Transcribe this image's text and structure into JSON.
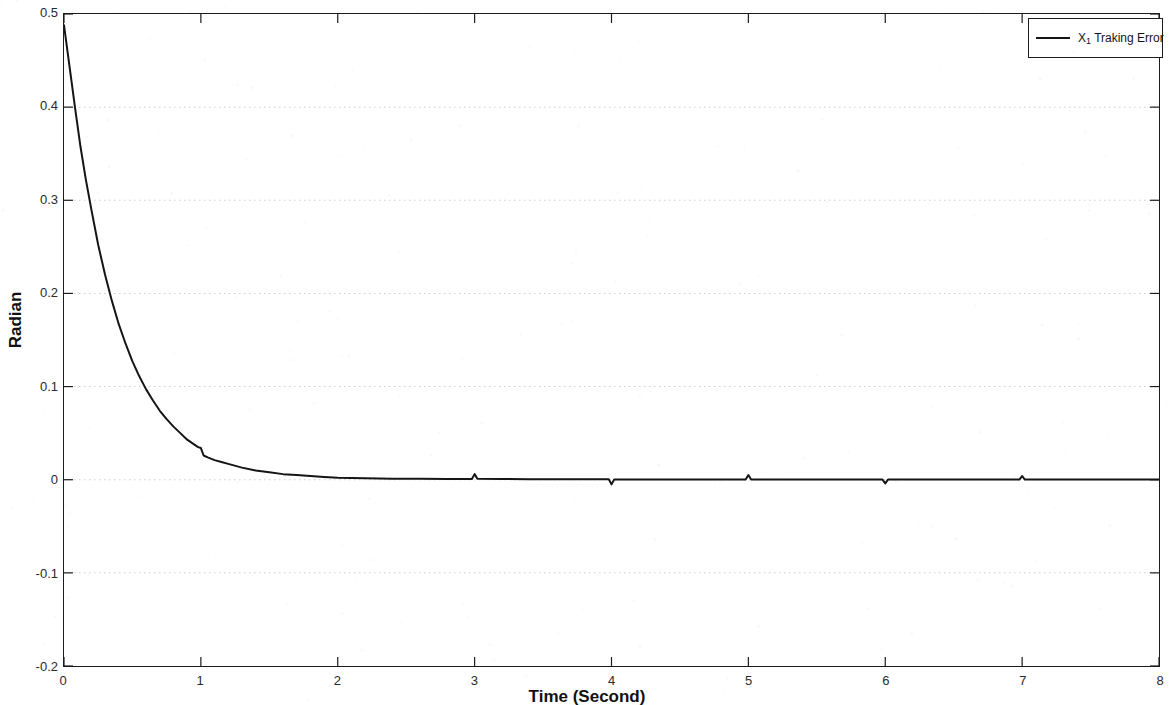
{
  "chart_data": {
    "type": "line",
    "title": "",
    "subtitle": "",
    "xlabel": "Time (Second)",
    "ylabel": "Radian",
    "xlim": [
      0,
      8
    ],
    "ylim": [
      -0.2,
      0.5
    ],
    "xticks": [
      "0",
      "1",
      "2",
      "3",
      "4",
      "5",
      "6",
      "7",
      "8"
    ],
    "xtick_values": [
      0,
      1,
      2,
      3,
      4,
      5,
      6,
      7,
      8
    ],
    "yticks": [
      "0.5",
      "0.4",
      "0.3",
      "0.2",
      "0.1",
      "0",
      "-0.1",
      "-0.2"
    ],
    "ytick_values": [
      0.5,
      0.4,
      0.3,
      0.2,
      0.1,
      0,
      -0.1,
      -0.2
    ],
    "grid": "horizontal-dotted",
    "grid_color": "#cfcfcf",
    "legend_position": "top-right",
    "line_color": "#151515",
    "line_width": 2.0,
    "series": [
      {
        "name": "X1 Traking Error",
        "label_base": "X",
        "label_sub": "1",
        "label_rest": " Traking Error",
        "x": [
          0,
          0.04,
          0.08,
          0.12,
          0.16,
          0.2,
          0.25,
          0.3,
          0.35,
          0.4,
          0.45,
          0.5,
          0.55,
          0.6,
          0.65,
          0.7,
          0.75,
          0.8,
          0.85,
          0.9,
          0.95,
          0.98,
          1.0,
          1.02,
          1.05,
          1.1,
          1.15,
          1.2,
          1.3,
          1.4,
          1.5,
          1.6,
          1.7,
          1.8,
          1.9,
          2.0,
          2.2,
          2.4,
          2.6,
          2.8,
          2.98,
          3.0,
          3.02,
          3.2,
          3.4,
          3.6,
          3.8,
          3.98,
          4.0,
          4.02,
          4.2,
          4.4,
          4.6,
          4.8,
          4.98,
          5.0,
          5.02,
          5.2,
          5.4,
          5.6,
          5.8,
          5.98,
          6.0,
          6.02,
          6.2,
          6.4,
          6.6,
          6.8,
          6.98,
          7.0,
          7.02,
          7.2,
          7.4,
          7.6,
          7.8,
          8.0
        ],
        "y": [
          0.488,
          0.444,
          0.4,
          0.358,
          0.322,
          0.29,
          0.252,
          0.22,
          0.192,
          0.167,
          0.146,
          0.127,
          0.111,
          0.097,
          0.085,
          0.074,
          0.065,
          0.057,
          0.05,
          0.043,
          0.038,
          0.035,
          0.034,
          0.026,
          0.024,
          0.021,
          0.019,
          0.017,
          0.013,
          0.01,
          0.008,
          0.006,
          0.005,
          0.004,
          0.003,
          0.002,
          0.0015,
          0.001,
          0.001,
          0.0008,
          0.0008,
          0.006,
          0.001,
          0.0008,
          0.0006,
          0.0005,
          0.0005,
          0.0005,
          -0.005,
          0.0003,
          0.0003,
          0.0003,
          0.0002,
          0.0002,
          0.0002,
          0.005,
          0.0002,
          0.0002,
          0.0002,
          0.0001,
          0.0001,
          0.0001,
          -0.004,
          0.0001,
          0.0001,
          0.0001,
          0.0001,
          0.0001,
          0.0001,
          0.004,
          0.0001,
          0.0001,
          0.0001,
          0.0001,
          0.0001,
          0.0001
        ],
        "description": "Exponential decay from 0.49 rad toward 0 with settling near t=1.5s, plus small transient spikes at t=1,3,4,5,6,7"
      }
    ],
    "annotations": [
      {
        "t": 1.0,
        "type": "spike-up",
        "magnitude": 0.008
      },
      {
        "t": 3.0,
        "type": "spike-up",
        "magnitude": 0.006
      },
      {
        "t": 4.0,
        "type": "spike-down",
        "magnitude": -0.005
      },
      {
        "t": 5.0,
        "type": "spike-up",
        "magnitude": 0.005
      },
      {
        "t": 6.0,
        "type": "spike-down",
        "magnitude": -0.004
      },
      {
        "t": 7.0,
        "type": "spike-up",
        "magnitude": 0.004
      }
    ]
  },
  "axes": {
    "xlabel": "Time (Second)",
    "ylabel": "Radian"
  },
  "legend": {
    "entries": [
      {
        "base": "X",
        "sub": "1",
        "rest": " Traking Error"
      }
    ]
  }
}
